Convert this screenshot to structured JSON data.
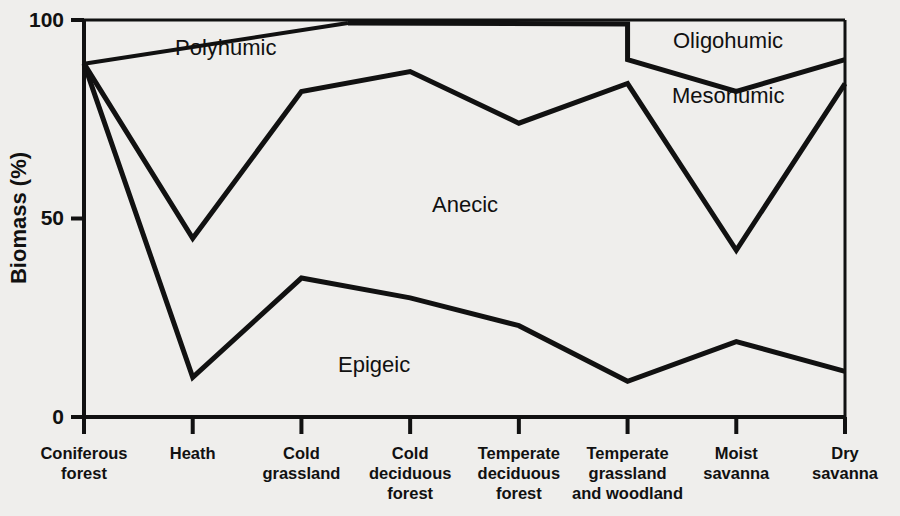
{
  "chart_data": {
    "type": "line",
    "title": "",
    "subtitle": "",
    "xlabel": "",
    "ylabel": "Biomass (%)",
    "ylim": [
      0,
      100
    ],
    "yticks": [
      "0",
      "50",
      "100"
    ],
    "ytick_values": [
      0,
      50,
      100
    ],
    "grid": false,
    "legend_position": "inline-annotations",
    "categories": [
      "Coniferous forest",
      "Heath",
      "Cold grassland",
      "Cold deciduous forest",
      "Temperate deciduous forest",
      "Temperate grassland and woodland",
      "Moist savanna",
      "Dry savanna"
    ],
    "category_lines": [
      [
        "Coniferous",
        "forest"
      ],
      [
        "Heath"
      ],
      [
        "Cold",
        "grassland"
      ],
      [
        "Cold",
        "deciduous",
        "forest"
      ],
      [
        "Temperate",
        "deciduous",
        "forest"
      ],
      [
        "Temperate",
        "grassland",
        "and woodland"
      ],
      [
        "Moist",
        "savanna"
      ],
      [
        "Dry",
        "savanna"
      ]
    ],
    "series": [
      {
        "name": "Epigeic boundary",
        "description": "upper edge of the Epigeic band (cumulative)",
        "values": [
          89,
          10,
          35,
          30,
          23,
          9,
          19,
          11.5
        ]
      },
      {
        "name": "Anecic boundary",
        "description": "upper edge of the Anecic band (cumulative)",
        "values": [
          89,
          45,
          82,
          87,
          74,
          84,
          42,
          84
        ]
      },
      {
        "name": "Mesohumic boundary",
        "description": "upper edge of the Mesohumic band; coincides with 100% until Temperate grassland, then drops",
        "values": [
          100,
          100,
          100,
          100,
          100,
          90,
          82,
          90
        ]
      },
      {
        "name": "Oligohumic boundary",
        "description": "top of the plot, 100% everywhere",
        "values": [
          100,
          100,
          100,
          100,
          100,
          100,
          100,
          100
        ]
      }
    ],
    "region_labels": [
      {
        "text": "Polyhumic",
        "x": 175,
        "y": 55
      },
      {
        "text": "Anecic",
        "x": 432,
        "y": 212
      },
      {
        "text": "Epigeic",
        "x": 338,
        "y": 372
      },
      {
        "text": "Oligohumic",
        "x": 673,
        "y": 48
      },
      {
        "text": "Mesohumic",
        "x": 672,
        "y": 103
      }
    ],
    "colors": {
      "line": "#111111",
      "axis": "#111111",
      "background": "#efeeec",
      "text": "#111111"
    }
  }
}
